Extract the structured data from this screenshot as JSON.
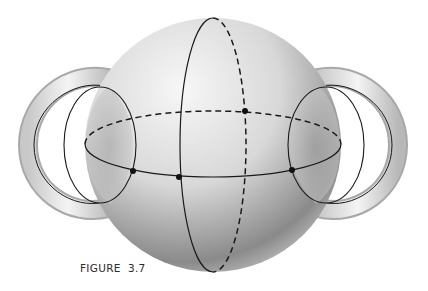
{
  "figure": {
    "caption": "FIGURE  3.7"
  },
  "colors": {
    "background": "#ffffff",
    "line": "#1a1a1a",
    "sphere_light": "#f2f2f2",
    "sphere_dark": "#6e6e6e"
  }
}
